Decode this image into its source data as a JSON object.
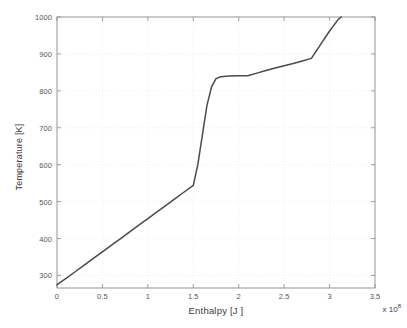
{
  "chart_data": {
    "type": "line",
    "title": "",
    "xlabel": "Enthalpy [J ]",
    "ylabel": "Temperature [K]",
    "x_multiplier": "x 10",
    "x_multiplier_exponent": "8",
    "xlim": [
      0,
      3.5
    ],
    "ylim": [
      266,
      1000
    ],
    "xticks": [
      0,
      0.5,
      1,
      1.5,
      2,
      2.5,
      3,
      3.5
    ],
    "xtick_labels": [
      "0",
      "0.5",
      "1",
      "1.5",
      "2",
      "2.5",
      "3",
      "3.5"
    ],
    "yticks": [
      300,
      400,
      500,
      600,
      700,
      800,
      900,
      1000
    ],
    "ytick_labels": [
      "300",
      "400",
      "500",
      "600",
      "700",
      "800",
      "900",
      "1000"
    ],
    "grid": true,
    "grid_style": "dotted",
    "legend": null,
    "series": [
      {
        "name": "Temperature vs Enthalpy",
        "color": "#4a4a4a",
        "line_width": 1.5,
        "x": [
          0.0,
          0.1,
          0.2,
          0.3,
          0.4,
          0.5,
          0.6,
          0.7,
          0.8,
          0.9,
          1.0,
          1.1,
          1.2,
          1.3,
          1.4,
          1.5,
          1.55,
          1.6,
          1.65,
          1.7,
          1.75,
          1.8,
          1.9,
          2.0,
          2.1,
          2.2,
          2.3,
          2.4,
          2.5,
          2.6,
          2.7,
          2.8,
          2.9,
          3.0,
          3.1,
          3.13
        ],
        "y": [
          275,
          292,
          310,
          328,
          346,
          364,
          382,
          400,
          418,
          436,
          454,
          472,
          490,
          508,
          526,
          544,
          600,
          680,
          760,
          810,
          833,
          838,
          840,
          841,
          841,
          848,
          855,
          862,
          868,
          874,
          881,
          888,
          925,
          962,
          995,
          1000
        ]
      }
    ],
    "annotations": [
      {
        "label": "melting plateau",
        "x_range": [
          1.75,
          2.1
        ],
        "y": 840
      },
      {
        "label": "kink",
        "x": 2.8,
        "y": 888
      }
    ],
    "colors": {
      "line": "#4a4a4a",
      "axis": "#8a8a8a",
      "grid": "#e8e8ec",
      "tick_text": "#555555",
      "label_text": "#3c3c3c",
      "background": "#ffffff"
    }
  }
}
